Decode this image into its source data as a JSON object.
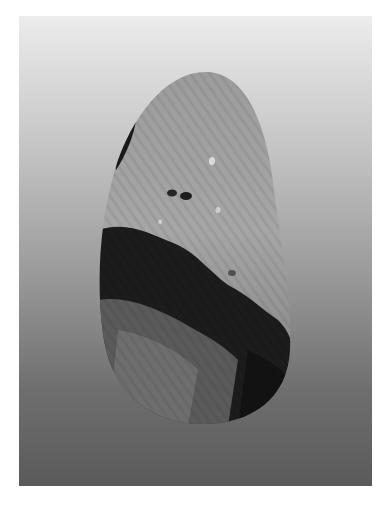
{
  "image": {
    "subject": "polished banded stone",
    "background": "vertical gray gradient, light top to dark bottom",
    "colors": {
      "frame": "#ffffff",
      "bg_top": "#ececec",
      "bg_bottom": "#5a5a5a",
      "stone_light": "#a8a8a8",
      "stone_dark": "#1a1a1a"
    }
  }
}
